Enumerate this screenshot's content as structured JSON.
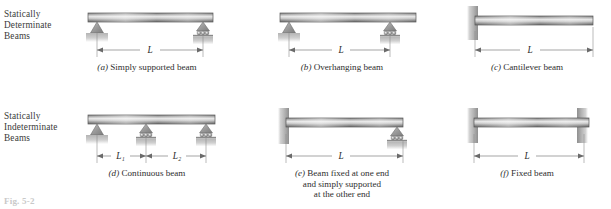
{
  "figure": {
    "label": "Fig. 5-2",
    "rows": [
      {
        "id": "determinate",
        "label": "Statically\nDeterminate\nBeams"
      },
      {
        "id": "indeterminate",
        "label": "Statically\nIndeterminate\nBeams"
      }
    ]
  },
  "row_labels": {
    "determinate": {
      "line1": "Statically",
      "line2": "Determinate",
      "line3": "Beams"
    },
    "indeterminate": {
      "line1": "Statically",
      "line2": "Indeterminate",
      "line3": "Beams"
    }
  },
  "panels": {
    "a": {
      "letter": "(a)",
      "caption": "Simply supported beam",
      "dimensions": [
        {
          "label": "L"
        }
      ],
      "supports": [
        {
          "type": "pin",
          "position": "left"
        },
        {
          "type": "roller",
          "position": "right"
        }
      ],
      "beam_overhang": "none"
    },
    "b": {
      "letter": "(b)",
      "caption": "Overhanging beam",
      "dimensions": [
        {
          "label": "L"
        }
      ],
      "supports": [
        {
          "type": "pin",
          "position": "left"
        },
        {
          "type": "roller",
          "position": "interior-right"
        }
      ],
      "beam_overhang": "right"
    },
    "c": {
      "letter": "(c)",
      "caption": "Cantilever beam",
      "dimensions": [
        {
          "label": "L"
        }
      ],
      "supports": [
        {
          "type": "fixed",
          "position": "left"
        }
      ],
      "beam_overhang": "none"
    },
    "d": {
      "letter": "(d)",
      "caption": "Continuous beam",
      "dimensions": [
        {
          "label": "L₁"
        },
        {
          "label": "L₂"
        }
      ],
      "supports": [
        {
          "type": "pin",
          "position": "left"
        },
        {
          "type": "roller",
          "position": "middle"
        },
        {
          "type": "roller",
          "position": "right"
        }
      ],
      "beam_overhang": "none"
    },
    "e": {
      "letter": "(e)",
      "caption_line1": "Beam fixed at one end",
      "caption_line2": "and simply supported",
      "caption_line3": "at the other end",
      "dimensions": [
        {
          "label": "L"
        }
      ],
      "supports": [
        {
          "type": "fixed",
          "position": "left"
        },
        {
          "type": "roller",
          "position": "right"
        }
      ],
      "beam_overhang": "none"
    },
    "f": {
      "letter": "(f)",
      "caption": "Fixed beam",
      "dimensions": [
        {
          "label": "L"
        }
      ],
      "supports": [
        {
          "type": "fixed",
          "position": "left"
        },
        {
          "type": "fixed",
          "position": "right"
        }
      ],
      "beam_overhang": "none"
    }
  },
  "colors": {
    "beam_dark": "#6e6e6e",
    "beam_light": "#e9e9e9",
    "beam_outline": "#585858",
    "support_fill": "#9a9a9a",
    "ground_fill": "#b8b8b8",
    "dimension_line": "#6a6a6a",
    "text": "#2e2e2e",
    "background": "#ffffff"
  }
}
